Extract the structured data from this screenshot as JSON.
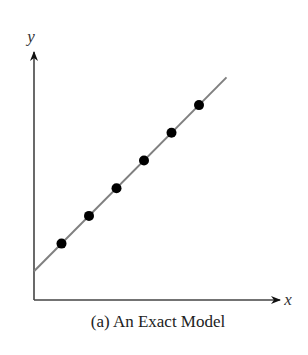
{
  "chart_data": {
    "type": "scatter",
    "title": "(a) An Exact Model",
    "xlabel": "x",
    "ylabel": "y",
    "grid": false,
    "ticks": false,
    "fit_line": {
      "x0": 0,
      "y0": 1,
      "x1": 7,
      "y1": 8,
      "color": "#808080"
    },
    "x": [
      1,
      2,
      3,
      4,
      5,
      6
    ],
    "y": [
      2,
      3,
      4,
      5,
      6,
      7
    ],
    "point_color": "#000000",
    "xlim": [
      0,
      9
    ],
    "ylim": [
      0,
      9
    ]
  },
  "labels": {
    "x_axis": "x",
    "y_axis": "y",
    "caption": "(a) An Exact Model"
  }
}
